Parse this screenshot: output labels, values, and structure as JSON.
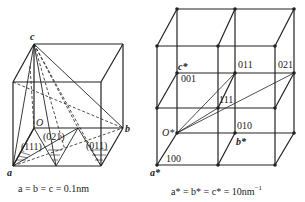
{
  "left_figure": {
    "labels": {
      "c": "c",
      "o": "O",
      "b": "b",
      "a": "a"
    },
    "planes": [
      "(111)",
      "(021)",
      "(011)"
    ],
    "caption": "a = b = c = 0.1nm"
  },
  "right_figure": {
    "labels": {
      "o_star": "O*",
      "a_star": "a*",
      "b_star": "b*",
      "c_star": "c*",
      "p100": "100",
      "p010": "010",
      "p001": "001",
      "p011": "011",
      "p021": "021",
      "p111": "111"
    },
    "caption_main": "a* = b* = c* = 10nm",
    "caption_sup": "−1"
  }
}
